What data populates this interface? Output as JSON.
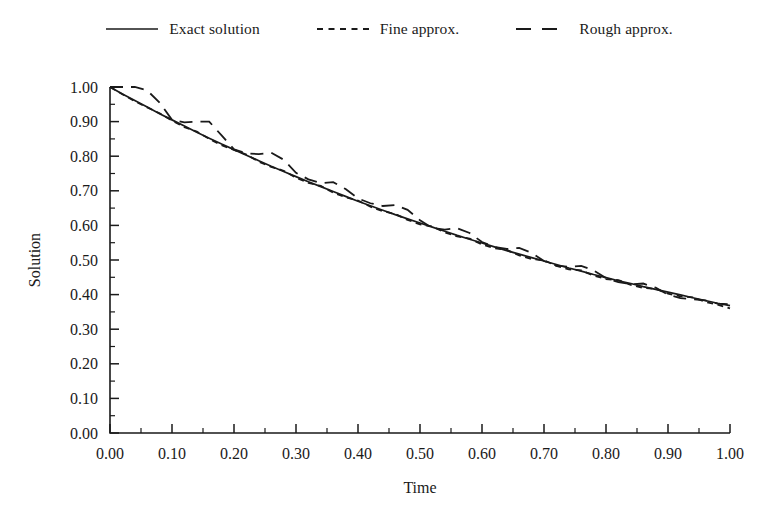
{
  "legend": {
    "position": "top-center",
    "entries": [
      {
        "label": "Exact solution",
        "style": "solid",
        "icon": "line-solid-icon"
      },
      {
        "label": "Fine approx.",
        "style": "short-dash",
        "icon": "line-short-dash-icon"
      },
      {
        "label": "Rough approx.",
        "style": "long-dash",
        "icon": "line-long-dash-icon"
      }
    ]
  },
  "axes": {
    "x": {
      "title": "Time",
      "ticks": [
        "0.00",
        "0.10",
        "0.20",
        "0.30",
        "0.40",
        "0.50",
        "0.60",
        "0.70",
        "0.80",
        "0.90",
        "1.00"
      ],
      "min": 0.0,
      "max": 1.0,
      "step": 0.1,
      "minor_ticks_per_interval": 1
    },
    "y": {
      "title": "Solution",
      "ticks": [
        "0.00",
        "0.10",
        "0.20",
        "0.30",
        "0.40",
        "0.50",
        "0.60",
        "0.70",
        "0.80",
        "0.90",
        "1.00"
      ],
      "min": 0.0,
      "max": 1.0,
      "step": 0.1,
      "minor_ticks_per_interval": 1
    }
  },
  "style": {
    "ink": "#1a1a1a",
    "background": "#ffffff"
  },
  "chart_data": {
    "type": "line",
    "title": "",
    "xlabel": "Time",
    "ylabel": "Solution",
    "xlim": [
      0.0,
      1.0
    ],
    "ylim": [
      0.0,
      1.0
    ],
    "grid": false,
    "legend": "top-center",
    "x": [
      0.0,
      0.02,
      0.04,
      0.06,
      0.08,
      0.1,
      0.12,
      0.14,
      0.16,
      0.18,
      0.2,
      0.22,
      0.24,
      0.26,
      0.28,
      0.3,
      0.32,
      0.34,
      0.36,
      0.38,
      0.4,
      0.42,
      0.44,
      0.46,
      0.48,
      0.5,
      0.52,
      0.54,
      0.56,
      0.58,
      0.6,
      0.62,
      0.64,
      0.66,
      0.68,
      0.7,
      0.72,
      0.74,
      0.76,
      0.78,
      0.8,
      0.82,
      0.84,
      0.86,
      0.88,
      0.9,
      0.92,
      0.94,
      0.96,
      0.98,
      1.0
    ],
    "series": [
      {
        "name": "Exact solution",
        "style": "solid",
        "values": [
          1.0,
          0.98,
          0.961,
          0.942,
          0.923,
          0.905,
          0.887,
          0.869,
          0.852,
          0.835,
          0.819,
          0.803,
          0.787,
          0.771,
          0.756,
          0.741,
          0.726,
          0.712,
          0.698,
          0.684,
          0.67,
          0.657,
          0.644,
          0.631,
          0.619,
          0.607,
          0.595,
          0.583,
          0.571,
          0.56,
          0.549,
          0.538,
          0.527,
          0.517,
          0.507,
          0.497,
          0.487,
          0.477,
          0.468,
          0.458,
          0.449,
          0.44,
          0.432,
          0.423,
          0.415,
          0.407,
          0.399,
          0.391,
          0.383,
          0.375,
          0.368
        ]
      },
      {
        "name": "Fine approx.",
        "style": "short-dash",
        "values": [
          1.0,
          0.979,
          0.959,
          0.941,
          0.924,
          0.903,
          0.884,
          0.871,
          0.85,
          0.832,
          0.818,
          0.805,
          0.784,
          0.769,
          0.758,
          0.738,
          0.723,
          0.714,
          0.695,
          0.681,
          0.672,
          0.654,
          0.641,
          0.633,
          0.616,
          0.603,
          0.597,
          0.58,
          0.568,
          0.562,
          0.545,
          0.534,
          0.529,
          0.513,
          0.503,
          0.499,
          0.483,
          0.473,
          0.47,
          0.455,
          0.445,
          0.442,
          0.428,
          0.419,
          0.417,
          0.403,
          0.395,
          0.392,
          0.379,
          0.371,
          0.36
        ]
      },
      {
        "name": "Rough approx.",
        "style": "long-dash",
        "values": [
          1.0,
          1.0,
          1.0,
          0.99,
          0.955,
          0.905,
          0.898,
          0.9,
          0.9,
          0.86,
          0.82,
          0.808,
          0.806,
          0.81,
          0.79,
          0.752,
          0.733,
          0.722,
          0.725,
          0.705,
          0.678,
          0.664,
          0.656,
          0.659,
          0.645,
          0.615,
          0.592,
          0.588,
          0.592,
          0.578,
          0.552,
          0.538,
          0.532,
          0.535,
          0.521,
          0.497,
          0.484,
          0.48,
          0.483,
          0.47,
          0.448,
          0.436,
          0.43,
          0.432,
          0.42,
          0.4,
          0.39,
          0.387,
          0.383,
          0.374,
          0.372
        ]
      }
    ],
    "annotations": []
  }
}
